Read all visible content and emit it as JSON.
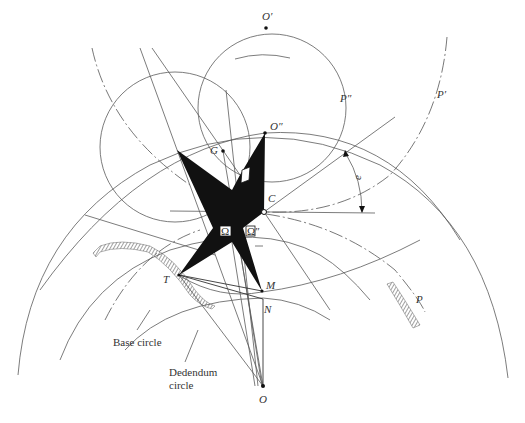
{
  "figure": {
    "type": "gear-tooth-geometry-diagram",
    "background": "#ffffff",
    "line_color": "#5a5a5a",
    "fill_color": "#111111"
  },
  "points": {
    "O_prime": {
      "label": "O′",
      "x": 266,
      "y": 28
    },
    "O_double_prime": {
      "label": "O″",
      "x": 265,
      "y": 133
    },
    "G": {
      "label": "G",
      "x": 223,
      "y": 151
    },
    "C": {
      "label": "C",
      "x": 264,
      "y": 212
    },
    "T": {
      "label": "T",
      "x": 179,
      "y": 275
    },
    "M": {
      "label": "M",
      "x": 262,
      "y": 291
    },
    "N": {
      "label": "N",
      "x": 263,
      "y": 299
    },
    "O": {
      "label": "O",
      "x": 263,
      "y": 386
    }
  },
  "curve_labels": {
    "P_prime": "P′",
    "P_double_prime": "P″",
    "P": "P"
  },
  "angle_label": "e",
  "omega_labels": {
    "omega_left": "Ω",
    "omega_right": "Ω″"
  },
  "captions": {
    "base_circle": "Base circle",
    "dedendum_line1": "Dedendum",
    "dedendum_line2": "circle"
  }
}
